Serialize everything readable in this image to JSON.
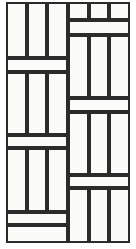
{
  "figure": {
    "type": "tile-pattern-diagram",
    "width": 136,
    "height": 249,
    "background_color": "#ffffff",
    "tile_fill_color": "#fbfbf9",
    "grout_line_color": "#2b2b2b",
    "outer_border_color": "#2b2b2b",
    "line_width_px": 2,
    "outer_line_width_px": 2.2
  },
  "geometry": {
    "frame": {
      "x": 6,
      "y": 2,
      "width": 124,
      "height": 241
    },
    "center_divider_x": 68,
    "left_column": {
      "x": 6,
      "width": 62
    },
    "right_column": {
      "x": 68,
      "width": 62
    },
    "left_row_edges": [
      2,
      58,
      72,
      135,
      148,
      212,
      225,
      243
    ],
    "right_row_edges": [
      2,
      20,
      35,
      98,
      112,
      175,
      188,
      243
    ],
    "strips_per_block": 3
  },
  "blocks": {
    "left": [
      {
        "name": "left-strip-block-1",
        "kind": "vertical-strips",
        "y": 2,
        "height": 56,
        "strips": 3
      },
      {
        "name": "left-band-1",
        "kind": "solid-band",
        "y": 58,
        "height": 14,
        "strips": 1
      },
      {
        "name": "left-strip-block-2",
        "kind": "vertical-strips",
        "y": 72,
        "height": 63,
        "strips": 3
      },
      {
        "name": "left-band-2",
        "kind": "solid-band",
        "y": 135,
        "height": 13,
        "strips": 1
      },
      {
        "name": "left-strip-block-3",
        "kind": "vertical-strips",
        "y": 148,
        "height": 64,
        "strips": 3
      },
      {
        "name": "left-band-3",
        "kind": "solid-band",
        "y": 212,
        "height": 13,
        "strips": 1
      },
      {
        "name": "left-band-4",
        "kind": "solid-band",
        "y": 225,
        "height": 18,
        "strips": 1
      }
    ],
    "right": [
      {
        "name": "right-strip-block-1",
        "kind": "vertical-strips",
        "y": 2,
        "height": 18,
        "strips": 3
      },
      {
        "name": "right-band-1",
        "kind": "solid-band",
        "y": 20,
        "height": 15,
        "strips": 1
      },
      {
        "name": "right-strip-block-2",
        "kind": "vertical-strips",
        "y": 35,
        "height": 63,
        "strips": 3
      },
      {
        "name": "right-band-2",
        "kind": "solid-band",
        "y": 98,
        "height": 14,
        "strips": 1
      },
      {
        "name": "right-strip-block-3",
        "kind": "vertical-strips",
        "y": 112,
        "height": 63,
        "strips": 3
      },
      {
        "name": "right-band-3",
        "kind": "solid-band",
        "y": 175,
        "height": 13,
        "strips": 1
      },
      {
        "name": "right-strip-block-4",
        "kind": "vertical-strips",
        "y": 188,
        "height": 55,
        "strips": 3
      }
    ]
  }
}
